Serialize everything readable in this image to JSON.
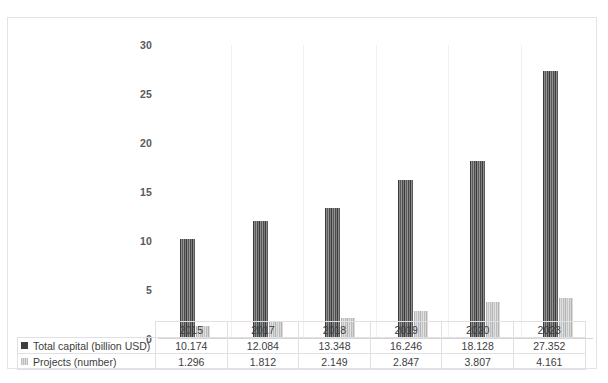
{
  "chart_data": {
    "type": "bar",
    "title": "",
    "subtitle": "",
    "xlabel": "",
    "ylabel": "",
    "categories": [
      "2015",
      "2017",
      "2018",
      "2019",
      "2020",
      "2023"
    ],
    "ylim": [
      0,
      30
    ],
    "yticks": [
      "30",
      "25",
      "20",
      "15",
      "10",
      "5",
      "0"
    ],
    "ytick_values": [
      30,
      25,
      20,
      15,
      10,
      5,
      0
    ],
    "grid": "vertical-category-separators-only",
    "legend_position": "data-table-row-headers",
    "series": [
      {
        "name": "Total capital (billion USD)",
        "color": "#3f3f3f",
        "values": [
          10.174,
          12.084,
          13.348,
          16.246,
          18.128,
          27.352
        ],
        "labels": [
          "10.174",
          "12.084",
          "13.348",
          "16.246",
          "18.128",
          "27.352"
        ]
      },
      {
        "name": "Projects (number)",
        "color": "#c9c9c9",
        "values": [
          1.296,
          1.812,
          2.149,
          2.847,
          3.807,
          4.161
        ],
        "labels": [
          "1.296",
          "1.812",
          "2.149",
          "2.847",
          "3.807",
          "4.161"
        ]
      }
    ]
  },
  "table": {
    "row_headers": [
      "Total capital (billion USD)",
      "Projects (number)"
    ],
    "corner_label": ""
  }
}
